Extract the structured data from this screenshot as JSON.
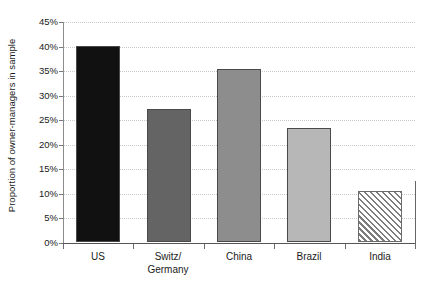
{
  "chart_data": {
    "type": "bar",
    "title": "",
    "subtitle": "",
    "xlabel": "",
    "ylabel": "Proportion of owner-managers in sample",
    "categories": [
      "US",
      "Switz/ Germany",
      "China",
      "Brazil",
      "India"
    ],
    "values": [
      40.0,
      27.0,
      35.3,
      23.3,
      10.3
    ],
    "value_unit": "percent",
    "ylim": [
      0,
      45
    ],
    "ytick_values": [
      0,
      5,
      10,
      15,
      20,
      25,
      30,
      35,
      40,
      45
    ],
    "ytick_labels": [
      "0%",
      "5%",
      "10%",
      "15%",
      "20%",
      "25%",
      "30%",
      "35%",
      "40%",
      "45%"
    ],
    "grid": true,
    "grid_axis": "y",
    "grid_style": "dotted",
    "legend": false,
    "legend_position": "none",
    "bar_styles": [
      {
        "category": "US",
        "fill": "#111111",
        "pattern": "solid"
      },
      {
        "category": "Switz/ Germany",
        "fill": "#646464",
        "pattern": "solid"
      },
      {
        "category": "China",
        "fill": "#8d8d8d",
        "pattern": "solid"
      },
      {
        "category": "Brazil",
        "fill": "#b7b7b7",
        "pattern": "solid"
      },
      {
        "category": "India",
        "fill": "#ffffff",
        "pattern": "diagonal-hatch"
      }
    ]
  },
  "axis": {
    "y_title": "Proportion of owner-managers in sample",
    "ticks": [
      {
        "label": "45%",
        "value": 45
      },
      {
        "label": "40%",
        "value": 40
      },
      {
        "label": "35%",
        "value": 35
      },
      {
        "label": "30%",
        "value": 30
      },
      {
        "label": "25%",
        "value": 25
      },
      {
        "label": "20%",
        "value": 20
      },
      {
        "label": "15%",
        "value": 15
      },
      {
        "label": "10%",
        "value": 10
      },
      {
        "label": "5%",
        "value": 5
      },
      {
        "label": "0%",
        "value": 0
      }
    ]
  },
  "categories": [
    {
      "line1": "US",
      "line2": ""
    },
    {
      "line1": "Switz/",
      "line2": "Germany"
    },
    {
      "line1": "China",
      "line2": ""
    },
    {
      "line1": "Brazil",
      "line2": ""
    },
    {
      "line1": "India",
      "line2": ""
    }
  ],
  "colors": {
    "grid": "#c9c9c9",
    "axis": "#555555",
    "text": "#1a1a1a",
    "background": "#ffffff"
  }
}
